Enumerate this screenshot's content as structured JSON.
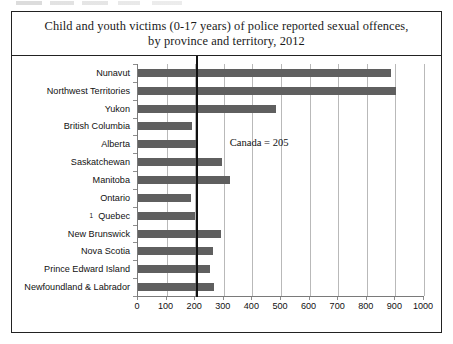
{
  "figure": {
    "title_line_1": "Child and youth victims (0-17 years) of police reported sexual offences,",
    "title_line_2": "by province and territory, 2012"
  },
  "annotation": {
    "canada_label": "Canada = 205"
  },
  "footnote": {
    "marker": "1"
  },
  "colors": {
    "bar": "#5f5f5f",
    "reference_line": "#111111",
    "gridline": "#b9b9b9",
    "axis": "#7a7a7a",
    "frame": "#222222"
  },
  "chart_data": {
    "type": "bar",
    "orientation": "horizontal",
    "title": "Child and youth victims (0-17 years) of police reported sexual offences, by province and territory, 2012",
    "xlabel": "",
    "ylabel": "",
    "xlim": [
      0,
      1000
    ],
    "xticks": [
      0,
      100,
      200,
      300,
      400,
      500,
      600,
      700,
      800,
      900,
      1000
    ],
    "xtick_labels": [
      "0",
      "100",
      "200",
      "300",
      "400",
      "500",
      "600",
      "700",
      "800",
      "900",
      "1000"
    ],
    "grid": true,
    "grid_axis": "x",
    "legend": false,
    "categories": [
      "Nunavut",
      "Northwest Territories",
      "Yukon",
      "British Columbia",
      "Alberta",
      "Saskatchewan",
      "Manitoba",
      "Ontario",
      "Quebec",
      "New Brunswick",
      "Nova Scotia",
      "Prince Edward Island",
      "Newfoundland & Labrador"
    ],
    "values": [
      884,
      902,
      481,
      190,
      203,
      295,
      320,
      185,
      198,
      290,
      262,
      250,
      265
    ],
    "annotations": [
      {
        "type": "vline",
        "value": 205,
        "label": "Canada = 205"
      }
    ]
  }
}
